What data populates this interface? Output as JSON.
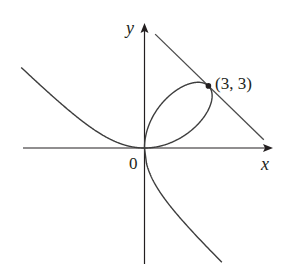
{
  "chart_data": {
    "type": "line",
    "title": "",
    "xlabel": "x",
    "ylabel": "y",
    "origin_label": "0",
    "series": [
      {
        "name": "folium",
        "equation": "x^3 + y^3 = 6xy",
        "parametric": {
          "x": "6t/(1+t^3)",
          "y": "6t^2/(1+t^3)"
        }
      },
      {
        "name": "tangent line",
        "equation": "x + y = 6",
        "x": [
          0.5,
          5.6
        ],
        "y": [
          5.5,
          0.4
        ]
      }
    ],
    "annotations": [
      {
        "text": "(3, 3)",
        "x": 3,
        "y": 3,
        "marker": "point"
      }
    ],
    "xlim": [
      -5.8,
      6.0
    ],
    "ylim": [
      -5.5,
      6.0
    ],
    "grid": false,
    "legend": "none"
  },
  "colors": {
    "curve": "#3d3d3d",
    "axis": "#231f20",
    "tangent": "#4a4a4a",
    "point": "#231f20"
  },
  "labels": {
    "x_axis": "x",
    "y_axis": "y",
    "origin": "0",
    "point": "(3, 3)"
  }
}
